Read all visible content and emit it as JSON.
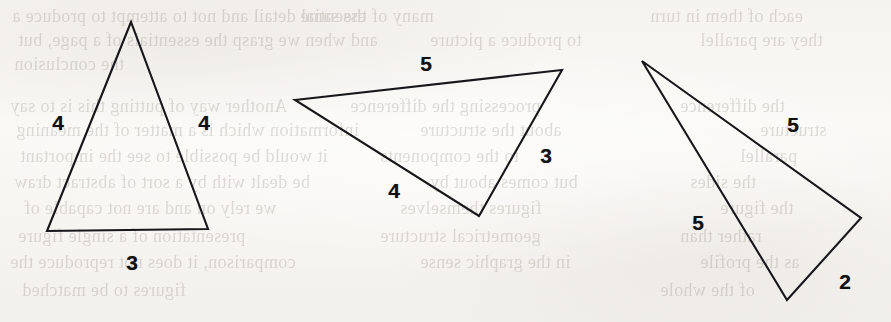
{
  "figure": {
    "kind": "geometry-figure",
    "background_color": "#f7f6f2",
    "stroke_color": "#17171a",
    "label_color": "#101012",
    "width": 891,
    "height": 322
  },
  "triangles": [
    {
      "id": "triangle-1",
      "name": "isosceles-triangle-4-4-3",
      "points": "131,22 47,231 208,229",
      "sides": [
        "4",
        "4",
        "3"
      ],
      "labels": [
        {
          "text": "4",
          "x": 58,
          "y": 122,
          "name": "triangle-1-side-label-left"
        },
        {
          "text": "4",
          "x": 204,
          "y": 122,
          "name": "triangle-1-side-label-right"
        },
        {
          "text": "3",
          "x": 132,
          "y": 262,
          "name": "triangle-1-side-label-bottom"
        }
      ]
    },
    {
      "id": "triangle-2",
      "name": "scalene-triangle-5-4-3",
      "points": "295,100 562,70 479,216",
      "sides": [
        "5",
        "3",
        "4"
      ],
      "labels": [
        {
          "text": "5",
          "x": 426,
          "y": 63,
          "name": "triangle-2-side-label-top"
        },
        {
          "text": "3",
          "x": 546,
          "y": 155,
          "name": "triangle-2-side-label-right"
        },
        {
          "text": "4",
          "x": 394,
          "y": 190,
          "name": "triangle-2-side-label-bottom"
        }
      ]
    },
    {
      "id": "triangle-3",
      "name": "isosceles-triangle-5-5-2",
      "points": "642,61 861,218 787,300",
      "sides": [
        "5",
        "2",
        "5"
      ],
      "labels": [
        {
          "text": "5",
          "x": 793,
          "y": 124,
          "name": "triangle-3-side-label-upper"
        },
        {
          "text": "2",
          "x": 845,
          "y": 281,
          "name": "triangle-3-side-label-short"
        },
        {
          "text": "5",
          "x": 698,
          "y": 222,
          "name": "triangle-3-side-label-left"
        }
      ]
    }
  ],
  "bleed_text": [
    {
      "text": "essential detail and not to attempt to produce a",
      "x": 12,
      "y": 6,
      "size": 18
    },
    {
      "text": "and when we grasp the essentials of a page, but",
      "x": 18,
      "y": 30,
      "size": 18
    },
    {
      "text": "the conclusion",
      "x": 14,
      "y": 54,
      "size": 18
    },
    {
      "text": "Another way of putting this is to say",
      "x": 10,
      "y": 96,
      "size": 18
    },
    {
      "text": "information which is a matter of the meaning",
      "x": 16,
      "y": 120,
      "size": 18
    },
    {
      "text": "it would be possible to see the important",
      "x": 20,
      "y": 146,
      "size": 18
    },
    {
      "text": "be dealt with by a sort of abstract draw",
      "x": 14,
      "y": 172,
      "size": 18
    },
    {
      "text": "we rely on and are not capable of",
      "x": 24,
      "y": 198,
      "size": 18
    },
    {
      "text": "presentation of a single figure",
      "x": 18,
      "y": 226,
      "size": 18
    },
    {
      "text": "comparison, it does not reproduce the",
      "x": 10,
      "y": 252,
      "size": 18
    },
    {
      "text": "figures to be matched",
      "x": 22,
      "y": 280,
      "size": 18
    },
    {
      "text": "many of the same",
      "x": 300,
      "y": 6,
      "size": 18
    },
    {
      "text": "to produce a picture",
      "x": 430,
      "y": 30,
      "size": 18
    },
    {
      "text": "processing the difference",
      "x": 350,
      "y": 96,
      "size": 18
    },
    {
      "text": "about the structure",
      "x": 420,
      "y": 120,
      "size": 18
    },
    {
      "text": "to the components",
      "x": 380,
      "y": 146,
      "size": 18
    },
    {
      "text": "but comes about by",
      "x": 430,
      "y": 172,
      "size": 18
    },
    {
      "text": "figures themselves",
      "x": 400,
      "y": 198,
      "size": 18
    },
    {
      "text": "geometrical structure",
      "x": 380,
      "y": 226,
      "size": 18
    },
    {
      "text": "in the graphic sense",
      "x": 420,
      "y": 252,
      "size": 18
    },
    {
      "text": "each of them in turn",
      "x": 650,
      "y": 6,
      "size": 18
    },
    {
      "text": "they are parallel",
      "x": 700,
      "y": 30,
      "size": 18
    },
    {
      "text": "the difference",
      "x": 680,
      "y": 96,
      "size": 18
    },
    {
      "text": "structure",
      "x": 760,
      "y": 120,
      "size": 18
    },
    {
      "text": "parallel",
      "x": 740,
      "y": 146,
      "size": 18
    },
    {
      "text": "the sides",
      "x": 690,
      "y": 172,
      "size": 18
    },
    {
      "text": "the figure",
      "x": 720,
      "y": 198,
      "size": 18
    },
    {
      "text": "rather than",
      "x": 680,
      "y": 226,
      "size": 18
    },
    {
      "text": "as the profile",
      "x": 700,
      "y": 252,
      "size": 18
    },
    {
      "text": "of the whole",
      "x": 660,
      "y": 280,
      "size": 18
    }
  ]
}
